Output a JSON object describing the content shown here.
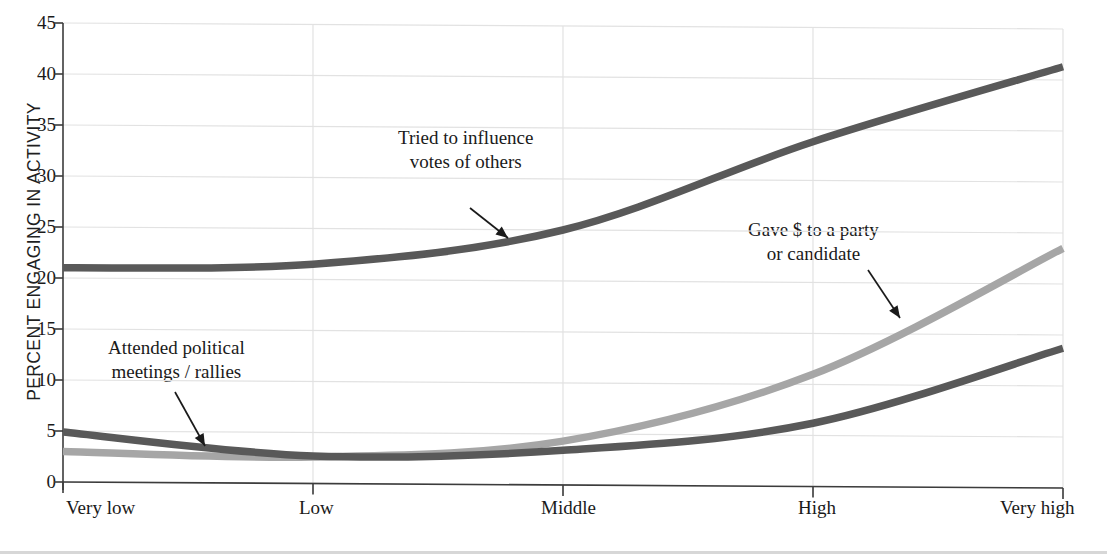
{
  "chart_data": {
    "type": "line",
    "title": "",
    "xlabel": "",
    "ylabel": "PERCENT ENGAGING IN ACTIVITY",
    "categories": [
      "Very low",
      "Low",
      "Middle",
      "High",
      "Very high"
    ],
    "ylim": [
      0,
      45
    ],
    "yticks": [
      0,
      5,
      10,
      15,
      20,
      25,
      30,
      35,
      40,
      45
    ],
    "ytick_labels": [
      "0",
      "5",
      "10",
      "15",
      "20",
      "25",
      "30",
      "35",
      "40",
      "45"
    ],
    "grid": true,
    "grid_axis": "y",
    "legend": "annotations",
    "series": [
      {
        "name": "Tried to influence votes of others",
        "values": [
          21.0,
          21.5,
          25.0,
          33.8,
          41.3
        ],
        "color": "#595959"
      },
      {
        "name": "Gave $ to a party or candidate",
        "values": [
          3.0,
          2.6,
          4.3,
          11.0,
          23.5
        ],
        "color": "#a6a6a6"
      },
      {
        "name": "Attended political meetings / rallies",
        "values": [
          4.9,
          2.7,
          3.4,
          6.2,
          13.7
        ],
        "color": "#595959"
      }
    ],
    "annotations": [
      {
        "id": "meetings",
        "line1": "Attended political",
        "line2": "meetings / rallies",
        "points_to_series": "Attended political meetings / rallies"
      },
      {
        "id": "influence",
        "line1": "Tried to influence",
        "line2": "votes of others",
        "points_to_series": "Tried to influence votes of others"
      },
      {
        "id": "gave",
        "line1": "Gave $ to a party",
        "line2": "or candidate",
        "points_to_series": "Gave $ to a party or candidate"
      }
    ]
  },
  "axis": {
    "ylabel": "PERCENT ENGAGING IN ACTIVITY",
    "yticks": [
      "45",
      "40",
      "35",
      "30",
      "25",
      "20",
      "15",
      "10",
      "5",
      "0"
    ],
    "xticks": [
      "Very low",
      "Low",
      "Middle",
      "High",
      "Very high"
    ]
  },
  "colors": {
    "dark_line": "#595959",
    "light_line": "#a6a6a6",
    "grid": "#e2e2e2",
    "axis": "#3c3c3c",
    "background": "#ffffff",
    "text": "#1a1a1a"
  }
}
